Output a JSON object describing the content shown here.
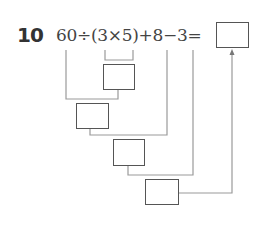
{
  "problem": {
    "number": "10",
    "expression": "60÷(3×5)+8−3=",
    "answer_box": "",
    "steps": [
      {
        "label": "3×5",
        "value": ""
      },
      {
        "label": "60÷(3×5)",
        "value": ""
      },
      {
        "label": "60÷(3×5)+8",
        "value": ""
      },
      {
        "label": "60÷(3×5)+8−3",
        "value": ""
      }
    ]
  },
  "colors": {
    "line": "#999999",
    "box_border": "#555555",
    "text": "#444444"
  }
}
